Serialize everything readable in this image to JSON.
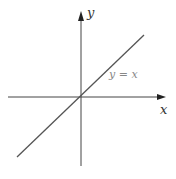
{
  "diagram": {
    "type": "graph-of-function",
    "axes": {
      "x_label": "x",
      "y_label": "y"
    },
    "curve": {
      "equation_label": "y = x",
      "description": "straight line through origin with slope 1"
    },
    "colors": {
      "axes": "#333333",
      "line": "#555555",
      "label_text": "#777777"
    }
  }
}
